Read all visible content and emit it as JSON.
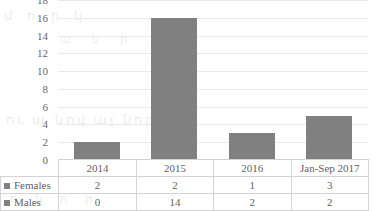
{
  "chart_data": {
    "type": "bar",
    "title": "",
    "xlabel": "",
    "ylabel": "",
    "ylim": [
      0,
      18
    ],
    "ytick_step": 2,
    "yticks": [
      18,
      16,
      14,
      12,
      10,
      8,
      6,
      4,
      2,
      0
    ],
    "grid": true,
    "legend_position": "data-table-left",
    "categories": [
      "2014",
      "2015",
      "2016",
      "Jan-Sep 2017"
    ],
    "values": [
      2,
      16,
      3,
      5
    ],
    "series": [
      {
        "name": "Females",
        "values": [
          2,
          2,
          1,
          3
        ]
      },
      {
        "name": "Males",
        "values": [
          0,
          14,
          2,
          2
        ]
      }
    ],
    "bar_color": "#808080",
    "grid_color": "#e9e9e9",
    "note": "Bars show stacked totals of Females + Males per category"
  },
  "table": {
    "corner_label": "",
    "header": [
      "2014",
      "2015",
      "2016",
      "Jan-Sep 2017"
    ],
    "rows": [
      {
        "label": "Females",
        "cells": [
          "2",
          "2",
          "1",
          "3"
        ]
      },
      {
        "label": "Males",
        "cells": [
          "0",
          "14",
          "2",
          "2"
        ]
      }
    ]
  },
  "artifacts": {
    "ghost1": "մ ո ր կ",
    "ghost2": "ա ն ի",
    "ghost3": "ու ա նով ալ նորդ",
    "ghost4": "ո ն ո ր"
  }
}
